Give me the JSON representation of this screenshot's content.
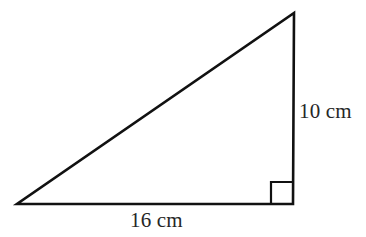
{
  "figure": {
    "name": "right-triangle-with-dimensions",
    "background_color": "#ffffff",
    "stroke_color": "#111111",
    "text_color": "#262626",
    "stroke_width": 2.6,
    "width": 366,
    "height": 237,
    "vertices": {
      "left": {
        "x": 17,
        "y": 204
      },
      "bottom_right": {
        "x": 293,
        "y": 204
      },
      "top": {
        "x": 294,
        "y": 13
      }
    },
    "right_angle_marker": {
      "name": "right-angle-square",
      "x": 271,
      "y": 182,
      "size": 22,
      "at_vertex": "bottom_right"
    },
    "labels": {
      "vertical_leg": "10 cm",
      "base_leg": "16 cm"
    },
    "sides": [
      {
        "name": "base",
        "label": "16 cm",
        "value": 16,
        "unit": "cm"
      },
      {
        "name": "height",
        "label": "10 cm",
        "value": 10,
        "unit": "cm"
      },
      {
        "name": "hypotenuse",
        "label": "",
        "value": null,
        "unit": "cm"
      }
    ]
  }
}
